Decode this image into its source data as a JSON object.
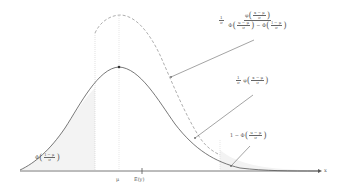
{
  "diagram": {
    "axis": {
      "x_label": "x"
    },
    "ticks": {
      "mu_label": "μ",
      "ey_label": "E(y)"
    },
    "bounds": {
      "lower": "l",
      "upper": "u"
    },
    "labels": {
      "truncated_density": {
        "prefix": "1/σ",
        "numerator": "φ((x−μ)/σ)",
        "denominator": "Φ((u−μ)/σ) − Φ((l−μ)/σ)",
        "num_fn": "φ",
        "num_arg_num": "x − μ",
        "num_arg_den": "σ",
        "den_fn1": "Φ",
        "den_arg1_num": "u − μ",
        "den_arg1_den": "σ",
        "minus": "−",
        "den_fn2": "Φ",
        "den_arg2_num": "l − μ",
        "den_arg2_den": "σ",
        "one": "1",
        "sigma": "σ"
      },
      "normal_density": {
        "one": "1",
        "sigma": "σ",
        "fn": "φ",
        "arg_num": "x − μ",
        "arg_den": "σ"
      },
      "upper_tail": {
        "prefix": "1 −",
        "fn": "Φ",
        "arg_num": "u − μ",
        "arg_den": "σ"
      },
      "lower_tail": {
        "fn": "Φ",
        "arg_num": "l − μ",
        "arg_den": "σ"
      }
    },
    "colors": {
      "curve": "#555555",
      "dashed": "#999999",
      "shade": "#f2f2f2",
      "axis": "#555555",
      "guide": "#cccccc"
    }
  }
}
